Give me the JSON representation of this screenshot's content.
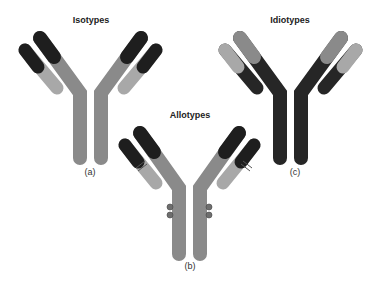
{
  "titles": {
    "isotypes": "Isotypes",
    "allotypes": "Allotypes",
    "idiotypes": "Idiotypes"
  },
  "labels": {
    "a": "(a)",
    "b": "(b)",
    "c": "(c)"
  },
  "colors": {
    "black": "#1e1e1e",
    "mid_gray": "#8a8a8a",
    "light_gray": "#a8a8a8",
    "dark_body": "#262626",
    "dot": "#6e6e6e"
  }
}
